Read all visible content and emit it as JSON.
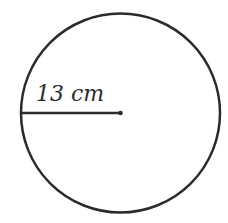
{
  "diagram": {
    "type": "circle-with-radius",
    "shape": "circle",
    "center": {
      "x": 120.5,
      "y": 113
    },
    "radius_px": 99.5,
    "stroke_color": "#2b2b2b",
    "stroke_width": 2.5,
    "radius_segment": {
      "from": {
        "x": 21,
        "y": 113
      },
      "to": {
        "x": 120.5,
        "y": 113
      },
      "endpoint_marker": "dot"
    },
    "label": {
      "text": "13 cm",
      "value": 13,
      "unit": "cm",
      "position": {
        "x": 36,
        "y": 101
      }
    }
  }
}
